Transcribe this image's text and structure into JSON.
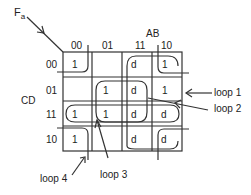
{
  "function_label": "F",
  "function_subscript": "a",
  "axis": {
    "columns_var": "AB",
    "rows_var": "CD",
    "column_headers": [
      "00",
      "01",
      "11",
      "10"
    ],
    "row_headers": [
      "00",
      "01",
      "11",
      "10"
    ]
  },
  "cells": [
    [
      "1",
      "",
      "d",
      "1"
    ],
    [
      "",
      "1",
      "d",
      "1"
    ],
    [
      "1",
      "1",
      "d",
      "d"
    ],
    [
      "1",
      "",
      "d",
      "d"
    ]
  ],
  "loops": {
    "loop1": "loop 1",
    "loop2": "loop 2",
    "loop3": "loop 3",
    "loop4": "loop 4"
  },
  "colors": {
    "line": "#333333",
    "background": "#ffffff"
  }
}
